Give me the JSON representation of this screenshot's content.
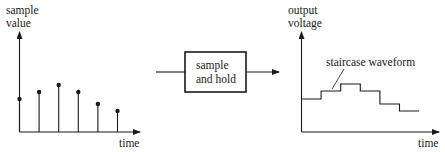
{
  "left_plot": {
    "y_label_line1": "sample",
    "y_label_line2": "value",
    "x_label": "time",
    "samples": [
      0.33,
      0.4,
      0.47,
      0.4,
      0.28,
      0.21
    ]
  },
  "block": {
    "label_line1": "sample",
    "label_line2": "and hold"
  },
  "right_plot": {
    "y_label_line1": "output",
    "y_label_line2": "voltage",
    "x_label": "time",
    "annotation": "staircase waveform",
    "levels": [
      0.33,
      0.41,
      0.48,
      0.41,
      0.28,
      0.21
    ]
  }
}
